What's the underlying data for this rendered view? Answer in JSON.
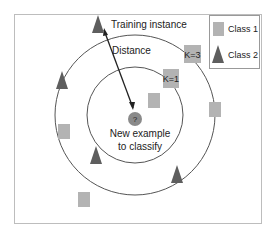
{
  "diagram": {
    "labels": {
      "training_instance": "Training instance",
      "distance": "Distance",
      "k3": "K=3",
      "k1": "K=1",
      "query_mark": "?",
      "new_example_line1": "New example",
      "new_example_line2": "to classify"
    },
    "legend": {
      "items": [
        {
          "label": "Class 1",
          "shape": "square"
        },
        {
          "label": "Class 2",
          "shape": "triangle"
        }
      ]
    },
    "colors": {
      "class1": "#b3b3b3",
      "class2": "#5e5e5e",
      "query": "#8a8a8a",
      "circle": "#555555",
      "border": "#bdbdbd",
      "text": "#222222"
    }
  }
}
